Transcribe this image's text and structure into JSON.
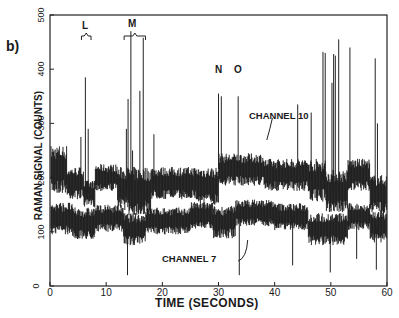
{
  "figure": {
    "panel_label": "b)",
    "annotations": {
      "L": "L",
      "M": "M",
      "N": "N",
      "O": "O",
      "channel10": "CHANNEL 10",
      "channel7": "CHANNEL 7"
    }
  },
  "chart_data": {
    "type": "line",
    "title": "",
    "panel": "b)",
    "xlabel": "TIME (SECONDS)",
    "ylabel": "RAMAN SIGNAL (COUNTS)",
    "xlim": [
      0,
      60
    ],
    "ylim": [
      0,
      500
    ],
    "xticks": [
      0,
      10,
      20,
      30,
      40,
      50,
      60
    ],
    "yticks": [
      0,
      100,
      200,
      300,
      400,
      500
    ],
    "grid": false,
    "legend": "none (inline labels)",
    "annotations": [
      {
        "text": "L",
        "x": 6.5,
        "y": 470,
        "type": "bracket"
      },
      {
        "text": "M",
        "x": 15.0,
        "y": 475,
        "type": "bracket"
      },
      {
        "text": "N",
        "x": 30.0,
        "y": 355
      },
      {
        "text": "O",
        "x": 33.5,
        "y": 355
      },
      {
        "text": "CHANNEL 10",
        "x": 40,
        "y": 260
      },
      {
        "text": "CHANNEL 7",
        "x": 25,
        "y": 75
      }
    ],
    "series": [
      {
        "name": "CHANNEL 10",
        "color": "#111111",
        "segments": [
          {
            "x0": 0,
            "x1": 3,
            "center": 215,
            "spread": 45
          },
          {
            "x0": 3,
            "x1": 6,
            "center": 190,
            "spread": 30
          },
          {
            "x0": 6,
            "x1": 8,
            "center": 170,
            "spread": 25
          },
          {
            "x0": 8,
            "x1": 12,
            "center": 200,
            "spread": 25
          },
          {
            "x0": 12,
            "x1": 14,
            "center": 180,
            "spread": 40
          },
          {
            "x0": 14,
            "x1": 18,
            "center": 175,
            "spread": 45
          },
          {
            "x0": 18,
            "x1": 26,
            "center": 190,
            "spread": 30
          },
          {
            "x0": 26,
            "x1": 30,
            "center": 185,
            "spread": 35
          },
          {
            "x0": 30,
            "x1": 38,
            "center": 215,
            "spread": 30
          },
          {
            "x0": 38,
            "x1": 46,
            "center": 205,
            "spread": 30
          },
          {
            "x0": 46,
            "x1": 49,
            "center": 195,
            "spread": 40
          },
          {
            "x0": 49,
            "x1": 53,
            "center": 175,
            "spread": 40
          },
          {
            "x0": 53,
            "x1": 57,
            "center": 205,
            "spread": 30
          },
          {
            "x0": 57,
            "x1": 60,
            "center": 170,
            "spread": 35
          }
        ],
        "spikes": [
          {
            "x": 5.5,
            "y": 275
          },
          {
            "x": 6.3,
            "y": 385
          },
          {
            "x": 6.8,
            "y": 290
          },
          {
            "x": 13.6,
            "y": 290
          },
          {
            "x": 13.9,
            "y": 345
          },
          {
            "x": 14.4,
            "y": 470
          },
          {
            "x": 14.7,
            "y": 250
          },
          {
            "x": 16.0,
            "y": 360
          },
          {
            "x": 16.6,
            "y": 458
          },
          {
            "x": 18.5,
            "y": 280
          },
          {
            "x": 30.0,
            "y": 355
          },
          {
            "x": 30.5,
            "y": 350
          },
          {
            "x": 33.5,
            "y": 350
          },
          {
            "x": 44.1,
            "y": 335
          },
          {
            "x": 46.5,
            "y": 320
          },
          {
            "x": 48.6,
            "y": 432
          },
          {
            "x": 49.0,
            "y": 430
          },
          {
            "x": 50.2,
            "y": 375
          },
          {
            "x": 50.5,
            "y": 428
          },
          {
            "x": 50.8,
            "y": 425
          },
          {
            "x": 51.4,
            "y": 455
          },
          {
            "x": 53.4,
            "y": 440
          },
          {
            "x": 57.9,
            "y": 420
          },
          {
            "x": 58.3,
            "y": 300
          }
        ]
      },
      {
        "name": "CHANNEL 7",
        "color": "#111111",
        "segments": [
          {
            "x0": 0,
            "x1": 4,
            "center": 125,
            "spread": 30
          },
          {
            "x0": 4,
            "x1": 8,
            "center": 115,
            "spread": 30
          },
          {
            "x0": 8,
            "x1": 13,
            "center": 125,
            "spread": 25
          },
          {
            "x0": 13,
            "x1": 17,
            "center": 105,
            "spread": 30
          },
          {
            "x0": 17,
            "x1": 25,
            "center": 120,
            "spread": 25
          },
          {
            "x0": 25,
            "x1": 29,
            "center": 130,
            "spread": 25
          },
          {
            "x0": 29,
            "x1": 33,
            "center": 118,
            "spread": 30
          },
          {
            "x0": 33,
            "x1": 40,
            "center": 135,
            "spread": 25
          },
          {
            "x0": 40,
            "x1": 46,
            "center": 128,
            "spread": 25
          },
          {
            "x0": 46,
            "x1": 53,
            "center": 105,
            "spread": 30
          },
          {
            "x0": 53,
            "x1": 57,
            "center": 128,
            "spread": 25
          },
          {
            "x0": 57,
            "x1": 60,
            "center": 110,
            "spread": 30
          }
        ],
        "dips": [
          {
            "x": 13.8,
            "y": 20
          },
          {
            "x": 33.7,
            "y": 20
          },
          {
            "x": 43.2,
            "y": 38
          },
          {
            "x": 49.9,
            "y": 25
          },
          {
            "x": 54.6,
            "y": 50
          },
          {
            "x": 58.1,
            "y": 30
          }
        ]
      }
    ]
  }
}
